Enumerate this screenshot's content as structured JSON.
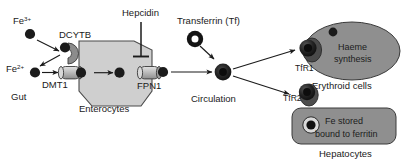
{
  "diagram": {
    "colors": {
      "iron_dot": "#1b1b1b",
      "cell_fill_light": "#cfcfcf",
      "cell_fill_mid": "#9a9a9a",
      "cell_fill_dark": "#8f8f8f",
      "outline": "#3a3a3a",
      "arrow": "#1b1b1b",
      "background": "#ffffff",
      "transporter_fill": "#b5b5b5"
    },
    "labels": {
      "fe3": "Fe",
      "fe3_sup": "3+",
      "fe2": "Fe",
      "fe2_sup": "2+",
      "gut": "Gut",
      "dcytb": "DCYTB",
      "dmt1": "DMT1",
      "enterocytes": "Enterocytes",
      "hepcidin": "Hepcidin",
      "fpn1": "FPN1",
      "transferrin": "Transferrin (Tf)",
      "circulation": "Circulation",
      "tfr1": "TfR1",
      "tfr2": "TfR2",
      "haeme_line1": "Haeme",
      "haeme_line2": "synthesis",
      "erythroid": "Erythroid cells",
      "ferritin_line1": "Fe stored",
      "ferritin_line2": "bound to ferritin",
      "hepatocytes": "Hepatocytes"
    },
    "nodes": [
      {
        "id": "fe3-dot",
        "name": "ferric-iron-particle",
        "type": "iron-particle"
      },
      {
        "id": "fe2-dot",
        "name": "ferrous-iron-particle",
        "type": "iron-particle"
      },
      {
        "id": "dcytb",
        "name": "dcytb-reductase",
        "type": "membrane-enzyme"
      },
      {
        "id": "dmt1",
        "name": "dmt1-transporter",
        "type": "membrane-channel"
      },
      {
        "id": "enterocyte",
        "name": "enterocyte-cell",
        "type": "cell-body"
      },
      {
        "id": "fpn1",
        "name": "fpn1-exporter",
        "type": "membrane-channel"
      },
      {
        "id": "hepcidin",
        "name": "hepcidin-inhibitor",
        "type": "inhibition"
      },
      {
        "id": "transferrin",
        "name": "transferrin-ring",
        "type": "carrier-protein"
      },
      {
        "id": "fe-tf",
        "name": "iron-transferrin-complex",
        "type": "complex"
      },
      {
        "id": "tfr1",
        "name": "tfr1-receptor",
        "type": "receptor"
      },
      {
        "id": "tfr2",
        "name": "tfr2-receptor",
        "type": "receptor"
      },
      {
        "id": "erythroid-cell",
        "name": "erythroid-cell-body",
        "type": "cell-body"
      },
      {
        "id": "hepatocyte-cell",
        "name": "hepatocyte-cell-body",
        "type": "cell-body"
      },
      {
        "id": "ferritin",
        "name": "ferritin-iron-store",
        "type": "storage-particle"
      }
    ],
    "edges": [
      {
        "from": "fe3-dot",
        "to": "dcytb",
        "kind": "arrow"
      },
      {
        "from": "dcytb",
        "to": "fe2-dot",
        "kind": "arrow"
      },
      {
        "from": "fe2-dot",
        "to": "dmt1",
        "kind": "arrow"
      },
      {
        "from": "dmt1",
        "to": "enterocyte",
        "kind": "arrow"
      },
      {
        "from": "enterocyte",
        "to": "fpn1",
        "kind": "arrow"
      },
      {
        "from": "hepcidin",
        "to": "fpn1",
        "kind": "inhibit"
      },
      {
        "from": "fpn1",
        "to": "fe-tf",
        "kind": "arrow"
      },
      {
        "from": "transferrin",
        "to": "fe-tf",
        "kind": "arrow"
      },
      {
        "from": "fe-tf",
        "to": "tfr1",
        "kind": "arrow"
      },
      {
        "from": "fe-tf",
        "to": "tfr2",
        "kind": "arrow"
      }
    ]
  }
}
